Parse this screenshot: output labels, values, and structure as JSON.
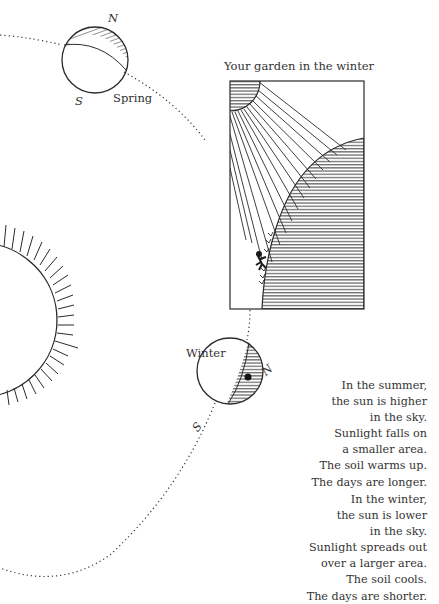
{
  "figure": {
    "title": "Your garden in the winter",
    "seasons": {
      "spring": {
        "label": "Spring",
        "north": "N",
        "south": "S"
      },
      "winter": {
        "label": "Winter",
        "north": "N",
        "south": "S"
      }
    }
  },
  "text": {
    "summer": [
      "In the summer,",
      "the sun is higher",
      "in the sky.",
      "Sunlight falls on",
      "a smaller area.",
      "The soil warms up.",
      "The days are longer."
    ],
    "winter": [
      "In the winter,",
      "the sun is lower",
      "in the sky.",
      "Sunlight spreads out",
      "over a larger area.",
      "The soil cools.",
      "The days are shorter."
    ]
  },
  "colors": {
    "ink": "#2a2a2a",
    "background": "#ffffff"
  }
}
